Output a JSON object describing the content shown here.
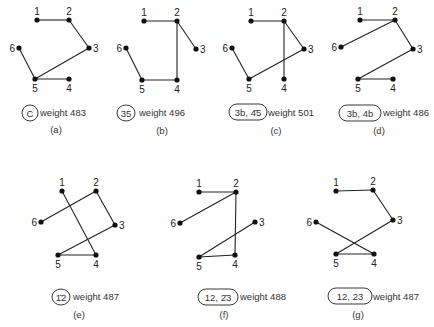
{
  "panels": [
    {
      "id": "a",
      "caption": "(a)",
      "badge": "C",
      "badge_shape": "circle",
      "weight_label": "weight 483",
      "nodes": {
        "1": [
          37,
          20
        ],
        "2": [
          69,
          20
        ],
        "3": [
          89,
          48
        ],
        "4": [
          69,
          79
        ],
        "5": [
          35,
          79
        ],
        "6": [
          19,
          48
        ]
      },
      "edges": [
        [
          "1",
          "2"
        ],
        [
          "2",
          "3"
        ],
        [
          "3",
          "5"
        ],
        [
          "5",
          "6"
        ],
        [
          "5",
          "4"
        ]
      ]
    },
    {
      "id": "b",
      "caption": "(b)",
      "badge": "35",
      "badge_shape": "circle",
      "weight_label": "weight 496",
      "nodes": {
        "1": [
          144,
          21
        ],
        "2": [
          177,
          21
        ],
        "3": [
          196,
          49
        ],
        "4": [
          177,
          80
        ],
        "5": [
          142,
          80
        ],
        "6": [
          126,
          48
        ]
      },
      "edges": [
        [
          "1",
          "2"
        ],
        [
          "2",
          "3"
        ],
        [
          "2",
          "4"
        ],
        [
          "4",
          "5"
        ],
        [
          "5",
          "6"
        ]
      ]
    },
    {
      "id": "c",
      "caption": "(c)",
      "badge": "3b, 4̄5",
      "badge_shape": "pill",
      "weight_label": "weight 501",
      "nodes": {
        "1": [
          251,
          21
        ],
        "2": [
          284,
          21
        ],
        "3": [
          304,
          49
        ],
        "4": [
          284,
          79
        ],
        "5": [
          249,
          79
        ],
        "6": [
          232,
          48
        ]
      },
      "edges": [
        [
          "1",
          "2"
        ],
        [
          "2",
          "3"
        ],
        [
          "2",
          "4"
        ],
        [
          "3",
          "5"
        ],
        [
          "5",
          "6"
        ]
      ]
    },
    {
      "id": "d",
      "caption": "(d)",
      "badge": "3b, 4b",
      "badge_shape": "pill",
      "weight_label": "weight 486",
      "nodes": {
        "1": [
          360,
          20
        ],
        "2": [
          395,
          20
        ],
        "3": [
          413,
          49
        ],
        "4": [
          393,
          79
        ],
        "5": [
          358,
          79
        ],
        "6": [
          341,
          47
        ]
      },
      "edges": [
        [
          "1",
          "2"
        ],
        [
          "2",
          "6"
        ],
        [
          "2",
          "3"
        ],
        [
          "3",
          "5"
        ],
        [
          "5",
          "4"
        ]
      ]
    },
    {
      "id": "e",
      "caption": "(e)",
      "badge": "1̄2",
      "badge_shape": "circle",
      "weight_label": "weight 487",
      "nodes": {
        "1": [
          62,
          191
        ],
        "2": [
          96,
          191
        ],
        "3": [
          115,
          225
        ],
        "4": [
          96,
          255
        ],
        "5": [
          58,
          255
        ],
        "6": [
          41,
          222
        ]
      },
      "edges": [
        [
          "1",
          "4"
        ],
        [
          "2",
          "6"
        ],
        [
          "2",
          "3"
        ],
        [
          "3",
          "5"
        ],
        [
          "5",
          "4"
        ]
      ]
    },
    {
      "id": "f",
      "caption": "(f)",
      "badge": "12, 2̄3",
      "badge_shape": "pill",
      "weight_label": "weight 488",
      "nodes": {
        "1": [
          199,
          192
        ],
        "2": [
          236,
          192
        ],
        "3": [
          255,
          222
        ],
        "4": [
          235,
          255
        ],
        "5": [
          199,
          257
        ],
        "6": [
          180,
          223
        ]
      },
      "edges": [
        [
          "1",
          "2"
        ],
        [
          "2",
          "6"
        ],
        [
          "2",
          "4"
        ],
        [
          "4",
          "5"
        ],
        [
          "5",
          "3"
        ]
      ]
    },
    {
      "id": "g",
      "caption": "(g)",
      "badge": "12, 23",
      "badge_shape": "pill",
      "weight_label": "weight 487",
      "nodes": {
        "1": [
          336,
          191
        ],
        "2": [
          373,
          190
        ],
        "3": [
          393,
          220
        ],
        "4": [
          374,
          254
        ],
        "5": [
          336,
          254
        ],
        "6": [
          316,
          222
        ]
      },
      "edges": [
        [
          "1",
          "2"
        ],
        [
          "2",
          "3"
        ],
        [
          "3",
          "5"
        ],
        [
          "5",
          "4"
        ],
        [
          "4",
          "6"
        ]
      ]
    }
  ],
  "layout": {
    "a": {
      "badge": [
        30,
        113
      ],
      "badge_w": 16,
      "weight": [
        40,
        116
      ],
      "caption": [
        56,
        133
      ]
    },
    "b": {
      "badge": [
        126,
        113
      ],
      "badge_w": 18,
      "weight": [
        139,
        116
      ],
      "caption": [
        162,
        134
      ]
    },
    "c": {
      "badge": [
        248,
        112
      ],
      "badge_w": 38,
      "weight": [
        268,
        116
      ],
      "caption": [
        276,
        134
      ]
    },
    "d": {
      "badge": [
        360,
        113
      ],
      "badge_w": 42,
      "weight": [
        383,
        116
      ],
      "caption": [
        379,
        134
      ]
    },
    "e": {
      "badge": [
        61,
        297
      ],
      "badge_w": 18,
      "weight": [
        73,
        300
      ],
      "caption": [
        79,
        318
      ]
    },
    "f": {
      "badge": [
        218,
        297
      ],
      "badge_w": 40,
      "weight": [
        240,
        300
      ],
      "caption": [
        224,
        318
      ]
    },
    "g": {
      "badge": [
        350,
        296
      ],
      "badge_w": 44,
      "weight": [
        373,
        300
      ],
      "caption": [
        358,
        318
      ]
    }
  }
}
